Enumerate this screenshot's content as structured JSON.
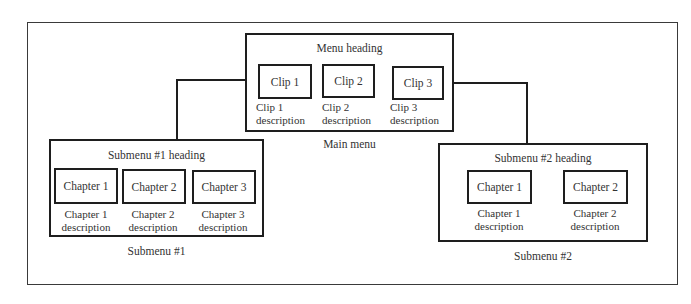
{
  "main_menu": {
    "heading": "Menu heading",
    "caption": "Main menu",
    "items": [
      {
        "label": "Clip 1",
        "desc1": "Clip 1",
        "desc2": "description"
      },
      {
        "label": "Clip 2",
        "desc1": "Clip 2",
        "desc2": "description"
      },
      {
        "label": "Clip 3",
        "desc1": "Clip 3",
        "desc2": "description"
      }
    ]
  },
  "submenu1": {
    "heading": "Submenu #1 heading",
    "caption": "Submenu #1",
    "items": [
      {
        "label": "Chapter 1",
        "desc1": "Chapter 1",
        "desc2": "description"
      },
      {
        "label": "Chapter 2",
        "desc1": "Chapter 2",
        "desc2": "description"
      },
      {
        "label": "Chapter 3",
        "desc1": "Chapter 3",
        "desc2": "description"
      }
    ]
  },
  "submenu2": {
    "heading": "Submenu #2 heading",
    "caption": "Submenu #2",
    "items": [
      {
        "label": "Chapter 1",
        "desc1": "Chapter 1",
        "desc2": "description"
      },
      {
        "label": "Chapter 2",
        "desc1": "Chapter 2",
        "desc2": "description"
      }
    ]
  }
}
